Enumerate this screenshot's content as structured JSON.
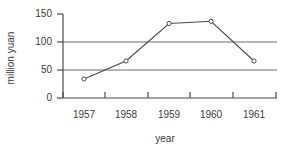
{
  "chart_data": {
    "type": "line",
    "title": "",
    "xlabel": "year",
    "ylabel": "million yuan",
    "categories": [
      "1957",
      "1958",
      "1959",
      "1960",
      "1961"
    ],
    "values": [
      34,
      66,
      133,
      137,
      66
    ],
    "series": [
      {
        "name": "million yuan",
        "values": [
          34,
          66,
          133,
          137,
          66
        ]
      }
    ],
    "yticks": [
      0,
      50,
      100,
      150
    ],
    "ytick_labels": [
      "0",
      "50",
      "100",
      "150"
    ],
    "ylim": [
      0,
      150
    ],
    "grid": "horizontal-at-50-and-100",
    "legend": "none",
    "marker": "open-circle",
    "line_color": "#4a4a4a",
    "grid_color": "#6a6a6a",
    "axis_color": "#4a4a4a",
    "text_color": "#3a3a3a"
  },
  "axes": {
    "y_title": "million yuan",
    "x_title": "year",
    "y_tick_labels": [
      "150",
      "100",
      "50",
      "0"
    ],
    "x_tick_labels": [
      "1957",
      "1958",
      "1959",
      "1960",
      "1961"
    ]
  }
}
